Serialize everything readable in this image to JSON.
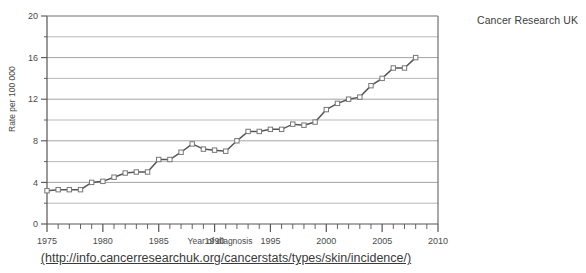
{
  "credit": "Cancer Research UK",
  "source_url": "(http://info.cancerresearchuk.org/cancerstats/types/skin/incidence/)",
  "chart_data": {
    "type": "line",
    "title": "",
    "subtitle": "",
    "xlabel": "Year of diagnosis",
    "ylabel": "Rate per 100 000",
    "xlim": [
      1975,
      2010
    ],
    "ylim": [
      0,
      20
    ],
    "grid": true,
    "grid_values": [
      0,
      2,
      4,
      6,
      8,
      10,
      12,
      14,
      16,
      18,
      20
    ],
    "ytick_labels": [
      "0",
      "4",
      "8",
      "12",
      "16",
      "20"
    ],
    "ytick_values": [
      0,
      4,
      8,
      12,
      16,
      20
    ],
    "yminor_values": [
      2,
      6,
      10,
      14,
      18
    ],
    "xtick_labels": [
      "1975",
      "1980",
      "1985",
      "1990",
      "1995",
      "2000",
      "2005",
      "2010"
    ],
    "xtick_values": [
      1975,
      1980,
      1985,
      1990,
      1995,
      2000,
      2005,
      2010
    ],
    "xminor_step": 1,
    "legend": [],
    "legend_position": "none",
    "marker": "open-square",
    "line_color": "#555555",
    "marker_color": "#777777",
    "grid_color": "#999999",
    "axis_color": "#555555",
    "x": [
      1975,
      1976,
      1977,
      1978,
      1979,
      1980,
      1981,
      1982,
      1983,
      1984,
      1985,
      1986,
      1987,
      1988,
      1989,
      1990,
      1991,
      1992,
      1993,
      1994,
      1995,
      1996,
      1997,
      1998,
      1999,
      2000,
      2001,
      2002,
      2003,
      2004,
      2005,
      2006,
      2007,
      2008
    ],
    "values": [
      3.2,
      3.3,
      3.3,
      3.3,
      4.0,
      4.1,
      4.5,
      4.9,
      5.0,
      5.0,
      6.2,
      6.2,
      6.9,
      7.7,
      7.2,
      7.1,
      7.0,
      8.0,
      8.9,
      8.9,
      9.1,
      9.1,
      9.6,
      9.5,
      9.8,
      11.0,
      11.6,
      12.0,
      12.2,
      13.3,
      14.0,
      15.0,
      15.0,
      16.0
    ],
    "series": [
      {
        "name": "Skin cancer (malignant melanoma) incidence rate",
        "values": [
          3.2,
          3.3,
          3.3,
          3.3,
          4.0,
          4.1,
          4.5,
          4.9,
          5.0,
          5.0,
          6.2,
          6.2,
          6.9,
          7.7,
          7.2,
          7.1,
          7.0,
          8.0,
          8.9,
          8.9,
          9.1,
          9.1,
          9.6,
          9.5,
          9.8,
          11.0,
          11.6,
          12.0,
          12.2,
          13.3,
          14.0,
          15.0,
          15.0,
          16.0
        ]
      }
    ]
  }
}
